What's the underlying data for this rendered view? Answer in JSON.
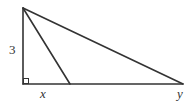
{
  "figure": {
    "type": "right-triangle-geometry",
    "stroke_color": "#333333",
    "background": "#ffffff",
    "vertices": {
      "top": [
        23,
        8
      ],
      "right_angle": [
        23,
        84
      ],
      "inner_foot": [
        70,
        84
      ],
      "far_right": [
        183,
        84
      ]
    },
    "labels": {
      "vertical_side": "3",
      "inner_base": "x",
      "far_vertex": "y"
    },
    "right_angle_marker": true
  }
}
